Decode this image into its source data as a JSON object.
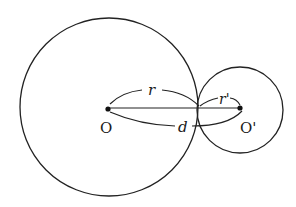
{
  "diagram": {
    "large_circle": {
      "center_label": "O",
      "radius_label": "r",
      "cx": 109,
      "cy": 107,
      "r": 89
    },
    "small_circle": {
      "center_label": "O'",
      "radius_label": "r'",
      "cx": 239,
      "cy": 110,
      "r": 43
    },
    "distance_label": "d",
    "stroke_color": "#222222"
  }
}
